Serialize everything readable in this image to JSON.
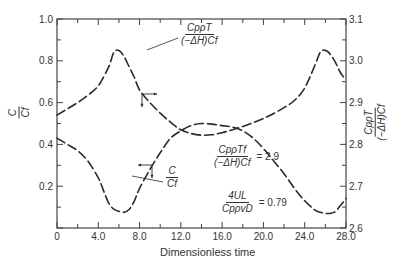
{
  "chart_data": {
    "type": "line",
    "title": "",
    "xlabel": "Dimensionless time",
    "ylabel_left": "C/Cf",
    "ylabel_right": "Cp ρ T / ((−ΔH) Cf)",
    "xlim": [
      0,
      28.0
    ],
    "ylim_left": [
      0,
      1.0
    ],
    "ylim_right": [
      2.6,
      3.1
    ],
    "x_ticks": [
      "0",
      "4.0",
      "8.0",
      "12.0",
      "16.0",
      "20.0",
      "24.0",
      "28.0"
    ],
    "y_ticks_left": [
      "0.2",
      "0.4",
      "0.6",
      "0.8",
      "1.0"
    ],
    "y_ticks_right": [
      "2.6",
      "2.7",
      "2.8",
      "2.9",
      "3.0",
      "3.1"
    ],
    "grid": false,
    "line_style": "dashed",
    "series": [
      {
        "name": "Cp ρ T / ((−ΔH) Cf)",
        "axis": "right",
        "x": [
          0,
          1,
          2,
          3,
          4,
          5,
          5.5,
          6,
          6.5,
          7,
          7.5,
          8,
          9,
          10,
          11,
          12,
          13,
          14,
          15,
          16,
          17,
          18,
          19,
          20,
          21,
          22,
          23,
          24,
          25,
          25.5,
          26,
          26.5,
          27,
          27.5,
          28
        ],
        "values": [
          2.87,
          2.885,
          2.9,
          2.918,
          2.94,
          2.985,
          3.02,
          3.025,
          3.01,
          2.985,
          2.96,
          2.93,
          2.9,
          2.875,
          2.853,
          2.835,
          2.826,
          2.822,
          2.823,
          2.828,
          2.835,
          2.843,
          2.852,
          2.862,
          2.874,
          2.888,
          2.905,
          2.935,
          2.99,
          3.02,
          3.025,
          3.015,
          2.995,
          2.97,
          2.955
        ],
        "values_left_scale": [
          0.54,
          0.57,
          0.6,
          0.64,
          0.68,
          0.77,
          0.84,
          0.85,
          0.82,
          0.77,
          0.72,
          0.66,
          0.6,
          0.55,
          0.505,
          0.47,
          0.452,
          0.444,
          0.446,
          0.456,
          0.47,
          0.486,
          0.504,
          0.524,
          0.548,
          0.576,
          0.61,
          0.67,
          0.78,
          0.84,
          0.85,
          0.83,
          0.79,
          0.74,
          0.71
        ]
      },
      {
        "name": "C/Cf",
        "axis": "left",
        "x": [
          0,
          1,
          2,
          3,
          4,
          4.5,
          5,
          5.5,
          6,
          6.5,
          7,
          7.5,
          8,
          9,
          10,
          11,
          12,
          13,
          14,
          15,
          16,
          17,
          18,
          19,
          20,
          21,
          22,
          23,
          24,
          25,
          25.5,
          26,
          26.5,
          27,
          27.5,
          28
        ],
        "values": [
          0.43,
          0.4,
          0.37,
          0.32,
          0.24,
          0.18,
          0.12,
          0.09,
          0.08,
          0.075,
          0.09,
          0.13,
          0.19,
          0.28,
          0.36,
          0.43,
          0.465,
          0.49,
          0.5,
          0.497,
          0.49,
          0.483,
          0.465,
          0.43,
          0.38,
          0.32,
          0.26,
          0.19,
          0.13,
          0.085,
          0.075,
          0.07,
          0.07,
          0.08,
          0.11,
          0.14
        ]
      }
    ],
    "annotations": [
      {
        "text": "Cp ρ T / ((−ΔH) Cf)",
        "target": "upper dashed curve near peak at t≈5.7"
      },
      {
        "text": "C / Cf",
        "target": "lower dashed curve near minimum at t≈7"
      },
      {
        "text": "Cp ρ Tf / ((−ΔH) Cf) = 2.9"
      },
      {
        "text": "4UL / (Cp ρ v D) = 0.79"
      },
      {
        "text": "→ (right-pointing arrow: temperature curve uses right axis)",
        "at_t": 8.0
      },
      {
        "text": "← (left-pointing arrow: concentration curve uses left axis)",
        "at_t": 9.2
      }
    ]
  },
  "labels": {
    "xlabel": "Dimensionless time",
    "ylabel_left_num": "C",
    "ylabel_left_den": "Cf",
    "ylabel_right_num": "CpρT",
    "ylabel_right_den": "(−ΔH)Cf",
    "ann_T_num": "CpρT",
    "ann_T_den": "(−ΔH)Cf",
    "ann_C_num": "C",
    "ann_C_den": "Cf",
    "eq1_num": "CpρTf",
    "eq1_den": "(−ΔH)Cf",
    "eq1_val": "= 2.9",
    "eq2_num": "4UL",
    "eq2_den": "CpρvD",
    "eq2_val": "= 0.79"
  },
  "colors": {
    "line": "#2a2a2a",
    "axis": "#444444",
    "text": "#333333",
    "background": "#ffffff"
  }
}
